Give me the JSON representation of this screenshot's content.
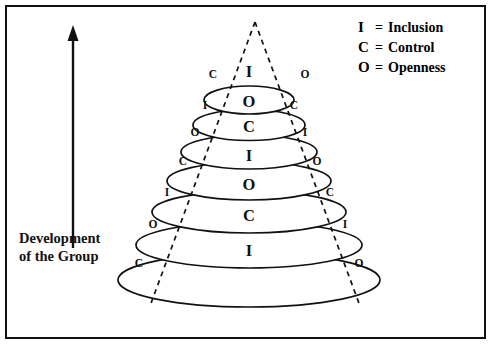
{
  "figure": {
    "axis_label_line1": "Development",
    "axis_label_line2": "of the Group",
    "arrow_direction": "up"
  },
  "legend": [
    {
      "key": "I",
      "eq": "=",
      "term": "Inclusion"
    },
    {
      "key": "C",
      "eq": "=",
      "term": "Control"
    },
    {
      "key": "O",
      "eq": "=",
      "term": "Openness"
    }
  ],
  "pyramid": {
    "rows": [
      {
        "center": "I",
        "left": "C",
        "right": "O"
      },
      {
        "center": "O",
        "left": "I",
        "right": "C"
      },
      {
        "center": "C",
        "left": "O",
        "right": "I"
      },
      {
        "center": "I",
        "left": "C",
        "right": "O"
      },
      {
        "center": "O",
        "left": "I",
        "right": "C"
      },
      {
        "center": "C",
        "left": "O",
        "right": "I"
      },
      {
        "center": "I",
        "left": "C",
        "right": "O"
      }
    ]
  },
  "colors": {
    "ink": "#111111",
    "background": "#ffffff",
    "frame": "#111111"
  }
}
